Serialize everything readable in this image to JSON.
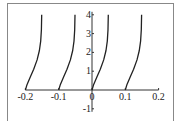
{
  "chart_data": {
    "type": "line",
    "title": "",
    "xlabel": "",
    "ylabel": "",
    "xlim": [
      -0.2,
      0.2
    ],
    "ylim": [
      -1,
      4
    ],
    "x_ticks": [
      "-0.2",
      "-0.1",
      "0",
      "0.1",
      "0.2"
    ],
    "y_ticks": [
      "-1",
      "1",
      "2",
      "3",
      "4"
    ],
    "grid": false,
    "legend": null,
    "line_color": "#222222",
    "series": [
      {
        "name": "curve-1",
        "points": [
          [
            -0.2,
            0
          ],
          [
            -0.195,
            0.3
          ],
          [
            -0.185,
            0.7
          ],
          [
            -0.175,
            1.1
          ],
          [
            -0.165,
            1.6
          ],
          [
            -0.158,
            2.1
          ],
          [
            -0.154,
            2.6
          ],
          [
            -0.152,
            3.2
          ],
          [
            -0.151,
            4
          ]
        ]
      },
      {
        "name": "curve-2",
        "points": [
          [
            -0.1,
            0
          ],
          [
            -0.095,
            0.3
          ],
          [
            -0.085,
            0.7
          ],
          [
            -0.075,
            1.1
          ],
          [
            -0.065,
            1.6
          ],
          [
            -0.058,
            2.1
          ],
          [
            -0.054,
            2.6
          ],
          [
            -0.052,
            3.2
          ],
          [
            -0.051,
            4
          ]
        ]
      },
      {
        "name": "curve-3",
        "points": [
          [
            0,
            0
          ],
          [
            0.005,
            0.3
          ],
          [
            0.015,
            0.7
          ],
          [
            0.025,
            1.1
          ],
          [
            0.035,
            1.6
          ],
          [
            0.042,
            2.1
          ],
          [
            0.046,
            2.6
          ],
          [
            0.048,
            3.2
          ],
          [
            0.049,
            4
          ]
        ]
      },
      {
        "name": "curve-4",
        "points": [
          [
            0.1,
            0
          ],
          [
            0.105,
            0.3
          ],
          [
            0.115,
            0.7
          ],
          [
            0.125,
            1.1
          ],
          [
            0.135,
            1.6
          ],
          [
            0.142,
            2.1
          ],
          [
            0.146,
            2.6
          ],
          [
            0.148,
            3.2
          ],
          [
            0.149,
            4
          ]
        ]
      }
    ]
  }
}
